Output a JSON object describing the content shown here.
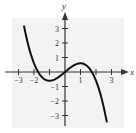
{
  "chart_data": {
    "type": "line",
    "title": "",
    "xlabel": "x",
    "ylabel": "y",
    "x_ticks": [
      -3,
      -2,
      -1,
      1,
      2,
      3
    ],
    "x_tick_labels": [
      "-3",
      "-2",
      "",
      "1",
      "",
      "3"
    ],
    "y_ticks": [
      -3,
      -2,
      -1,
      1,
      2,
      3
    ],
    "y_tick_labels": [
      "-3",
      "-2",
      "-1",
      "1",
      "2",
      "3"
    ],
    "xlim": [
      -3.4,
      4.0
    ],
    "ylim": [
      -3.7,
      4.0
    ],
    "grid": false,
    "legend": null,
    "series": [
      {
        "name": "f(x)",
        "description": "cubic curve through origin with local min near (-1,-0.6) and local max near (1,0.6); roots near -1.7, 0, 1.7",
        "x": [
          -2.65,
          -2.4,
          -2.2,
          -2.0,
          -1.8,
          -1.6,
          -1.4,
          -1.2,
          -1.0,
          -0.8,
          -0.6,
          -0.4,
          -0.2,
          0.0,
          0.2,
          0.4,
          0.6,
          0.8,
          1.0,
          1.2,
          1.4,
          1.6,
          1.8,
          2.0,
          2.2,
          2.4,
          2.7
        ],
        "y": [
          3.2,
          2.2,
          1.4,
          0.6,
          0.13,
          -0.21,
          -0.44,
          -0.56,
          -0.6,
          -0.57,
          -0.48,
          -0.34,
          -0.18,
          0.0,
          0.18,
          0.34,
          0.48,
          0.57,
          0.6,
          0.56,
          0.44,
          0.21,
          -0.13,
          -0.6,
          -1.4,
          -2.2,
          -3.6
        ]
      }
    ],
    "colors": {
      "curve": "#111111",
      "axes": "#333333",
      "panel": "#f3f3f3"
    }
  }
}
